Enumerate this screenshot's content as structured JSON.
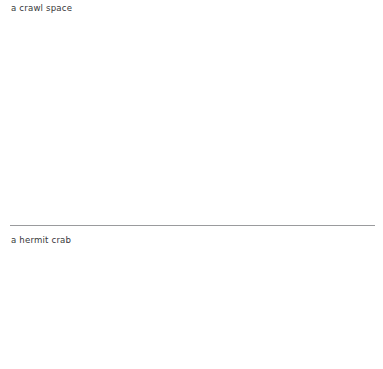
{
  "page": {
    "background_color": "#ffffff",
    "width": 383,
    "height": 369
  },
  "entries": [
    {
      "id": "crawl-space",
      "text": "a crawl space",
      "color": "#37383a"
    },
    {
      "id": "hermit-crab",
      "text": "a hermit crab",
      "color": "#37383a"
    }
  ],
  "divider": {
    "color": "#9a9b9d",
    "thickness": 1
  }
}
